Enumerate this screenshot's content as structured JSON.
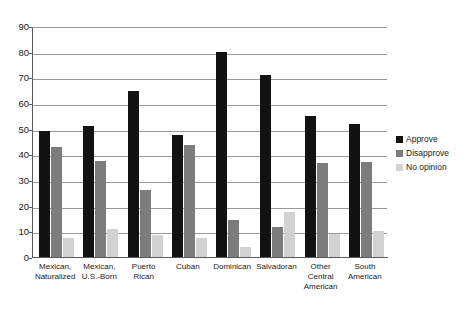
{
  "chart_data": {
    "type": "bar",
    "title": "",
    "subtitle": "",
    "xlabel": "",
    "ylabel": "",
    "ylim": [
      0,
      90
    ],
    "ytick_step": 10,
    "yticks": [
      0,
      10,
      20,
      30,
      40,
      50,
      60,
      70,
      80,
      90
    ],
    "grid": true,
    "legend_position": "right",
    "categories": [
      "Mexican,\nNaturalized",
      "Mexican,\nU.S.-Born",
      "Puerto\nRican",
      "Cuban",
      "Dominican",
      "Salvadoran",
      "Other\nCentral\nAmerican",
      "South\nAmerican"
    ],
    "series": [
      {
        "name": "Approve",
        "color": "#121212",
        "values": [
          49,
          51,
          64.5,
          47.5,
          80,
          71,
          55,
          52
        ]
      },
      {
        "name": "Disapprove",
        "color": "#7c7c7c",
        "values": [
          43,
          37.5,
          26,
          43.5,
          14.5,
          11.5,
          36.5,
          37
        ]
      },
      {
        "name": "No opinion",
        "color": "#d2d2d2",
        "values": [
          7.5,
          11,
          8.5,
          7.5,
          4,
          17.5,
          9,
          10
        ]
      }
    ]
  }
}
